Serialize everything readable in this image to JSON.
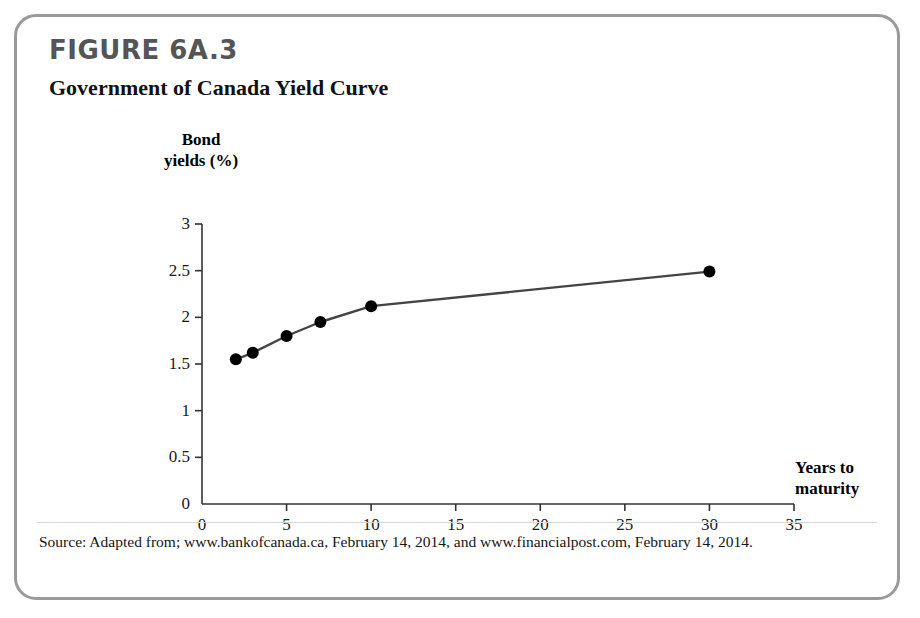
{
  "figure": {
    "number": "FIGURE 6A.3",
    "title": "Government of Canada Yield Curve",
    "source": "Source: Adapted from; www.bankofcanada.ca, February 14, 2014, and www.financialpost.com, February 14, 2014."
  },
  "chart_data": {
    "type": "line",
    "title": "Government of Canada Yield Curve",
    "xlabel": "Years to maturity",
    "ylabel": "Bond yields (%)",
    "xlim": [
      0,
      35
    ],
    "ylim": [
      0,
      3
    ],
    "xticks": [
      "0",
      "5",
      "10",
      "15",
      "20",
      "25",
      "30",
      "35"
    ],
    "xtick_values": [
      0,
      5,
      10,
      15,
      20,
      25,
      30,
      35
    ],
    "yticks": [
      "0",
      "0.5",
      "1",
      "1.5",
      "2",
      "2.5",
      "3"
    ],
    "ytick_values": [
      0,
      0.5,
      1,
      1.5,
      2,
      2.5,
      3
    ],
    "grid": false,
    "legend": false,
    "markers": true,
    "x": [
      2,
      3,
      5,
      7,
      10,
      30
    ],
    "values": [
      1.55,
      1.62,
      1.8,
      1.95,
      2.12,
      2.49
    ],
    "series": [
      {
        "name": "Government of Canada bond yields",
        "x": [
          2,
          3,
          5,
          7,
          10,
          30
        ],
        "values": [
          1.55,
          1.62,
          1.8,
          1.95,
          2.12,
          2.49
        ]
      }
    ]
  },
  "style": {
    "border_color": "#9a9a9a",
    "figure_number_color": "#555555",
    "line_color": "#444444",
    "marker_color": "#000000",
    "axis_color": "#333333"
  }
}
